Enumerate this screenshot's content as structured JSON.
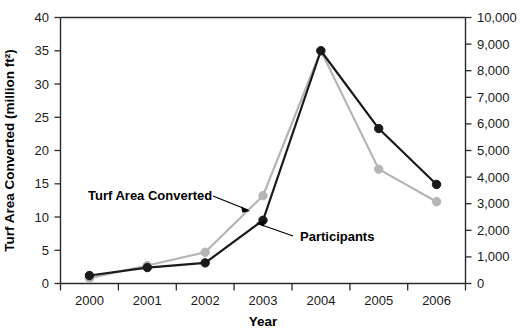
{
  "chart_data": {
    "type": "line",
    "title": "",
    "xlabel": "Year",
    "ylabel": "Turf Area Converted (million ft²)",
    "ylabel_right": "",
    "categories": [
      "2000",
      "2001",
      "2002",
      "2003",
      "2004",
      "2005",
      "2006"
    ],
    "xlim": [
      2000,
      2006
    ],
    "ylim": [
      0,
      40
    ],
    "ylim_right": [
      0,
      10000
    ],
    "y_ticks": [
      0,
      5,
      10,
      15,
      20,
      25,
      30,
      35,
      40
    ],
    "y_ticks_right": [
      0,
      1000,
      2000,
      3000,
      4000,
      5000,
      6000,
      7000,
      8000,
      9000,
      10000
    ],
    "y_tick_labels": [
      "0",
      "5",
      "10",
      "15",
      "20",
      "25",
      "30",
      "35",
      "40"
    ],
    "y_tick_labels_right": [
      "0",
      "1,000",
      "2,000",
      "3,000",
      "4,000",
      "5,000",
      "6,000",
      "7,000",
      "8,000",
      "9,000",
      "10,000"
    ],
    "grid": false,
    "legend": "annotations",
    "series": [
      {
        "name": "Turf Area Converted",
        "axis": "left",
        "color": "#b5b5b5",
        "marker": "circle",
        "values": [
          0.8,
          2.7,
          4.7,
          13.2,
          35.0,
          17.2,
          12.3
        ]
      },
      {
        "name": "Participants",
        "axis": "right",
        "color": "#1a1a1a",
        "marker": "circle",
        "values": [
          1.2,
          2.4,
          3.1,
          9.5,
          35.0,
          23.3,
          14.9
        ],
        "values_right_axis": [
          300,
          600,
          775,
          2375,
          8750,
          5825,
          3725
        ]
      }
    ],
    "annotations": [
      {
        "text": "Turf Area Converted",
        "series": "Turf Area Converted"
      },
      {
        "text": "Participants",
        "series": "Participants"
      }
    ]
  },
  "axes": {
    "x_title": "Year",
    "y_left_title": "Turf Area Converted (million ft²)"
  }
}
